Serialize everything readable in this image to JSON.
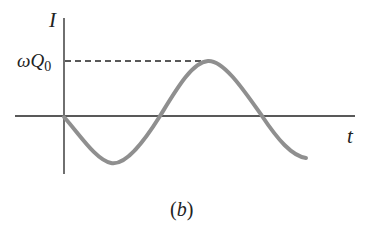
{
  "figure": {
    "y_axis_label": "I",
    "x_axis_label": "t",
    "level_label_symbol": "ωQ",
    "level_label_subscript": "0",
    "caption_open": "(",
    "caption_letter": "b",
    "caption_close": ")"
  },
  "colors": {
    "axes": "#222222",
    "curve": "#8f8f8f",
    "dashed": "#222222",
    "background": "#ffffff"
  },
  "curve": {
    "description": "current I(t) = -ωQ0 sin(ωt), starts at zero, dips negative, rises to peak ωQ0, returns below zero",
    "peak_value": "ωQ0"
  }
}
